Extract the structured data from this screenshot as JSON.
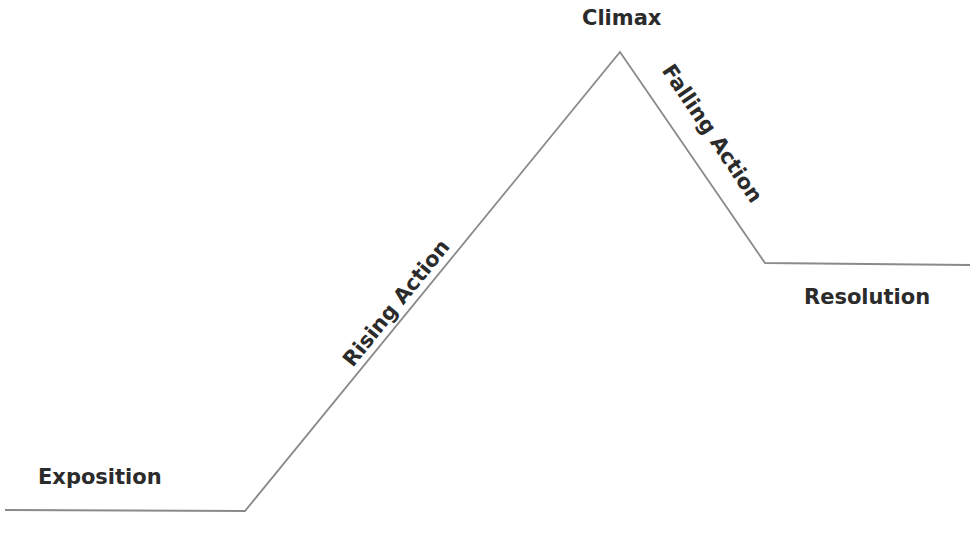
{
  "diagram": {
    "line_color": "#8a8a8a",
    "text_color": "#2b2b2b",
    "stages": [
      {
        "id": "exposition",
        "label": "Exposition"
      },
      {
        "id": "rising_action",
        "label": "Rising Action"
      },
      {
        "id": "climax",
        "label": "Climax"
      },
      {
        "id": "falling_action",
        "label": "Falling Action"
      },
      {
        "id": "resolution",
        "label": "Resolution"
      }
    ],
    "path_points": [
      [
        5,
        510
      ],
      [
        245,
        511
      ],
      [
        620,
        52
      ],
      [
        765,
        263
      ],
      [
        970,
        265
      ]
    ]
  }
}
